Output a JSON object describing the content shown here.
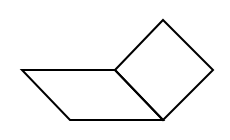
{
  "figure": {
    "width": 230,
    "height": 140,
    "background": "#ffffff",
    "stroke_color": "#000000",
    "stroke_width": 2,
    "shapes": [
      {
        "name": "parallelogram",
        "points": "22,70 115,70 163,120 70,120"
      },
      {
        "name": "square",
        "points": "115,70 163,20 213,70 163,120"
      }
    ]
  }
}
